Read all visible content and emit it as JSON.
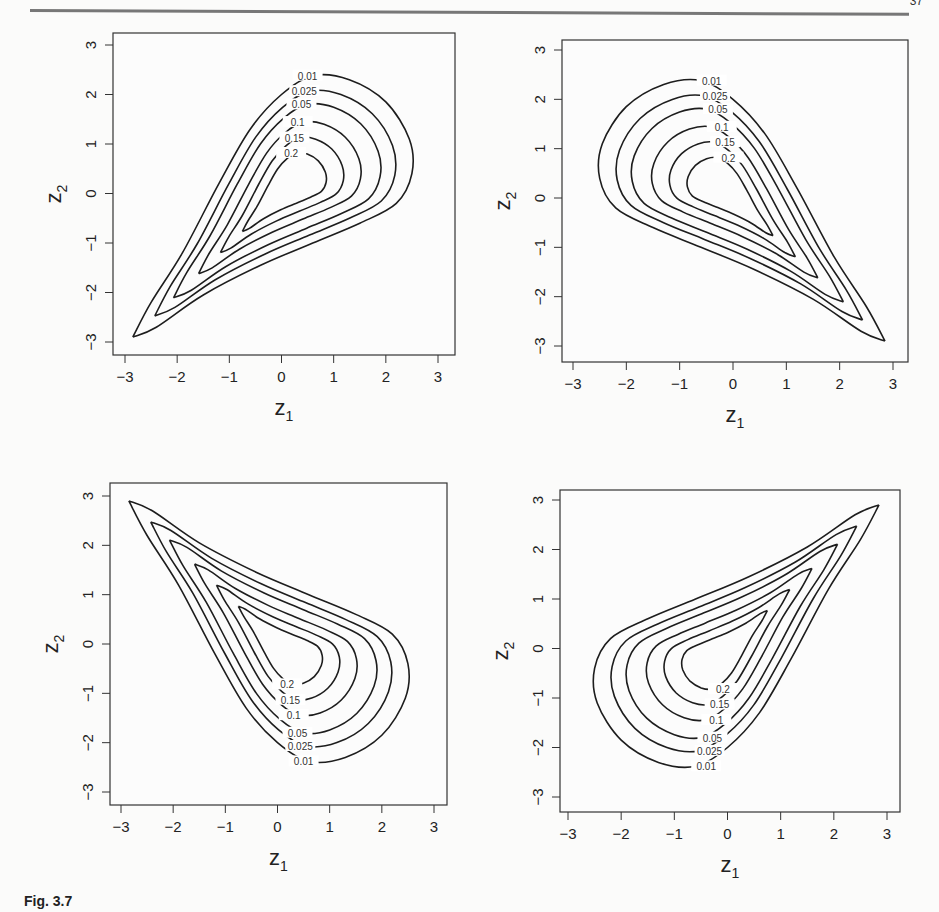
{
  "page": {
    "page_number": "37",
    "caption_fragment": "Fig. 3.7"
  },
  "chart_data": [
    {
      "type": "contour",
      "title": "",
      "position": "top-left",
      "xlabel": "z1",
      "ylabel": "z2",
      "xlim": [
        -3,
        3
      ],
      "ylim": [
        -3,
        3
      ],
      "xticks": [
        -3,
        -2,
        -1,
        0,
        1,
        2,
        3
      ],
      "yticks": [
        -3,
        -2,
        -1,
        0,
        1,
        2,
        3
      ],
      "levels": [
        0.01,
        0.025,
        0.05,
        0.1,
        0.15,
        0.2
      ],
      "orientation": "tail toward lower-left, bulb toward upper-right",
      "tail_point": [
        -2.85,
        -2.9
      ],
      "bulb_extent": {
        "max_x": 2.55,
        "max_y": 2.4
      },
      "grid": false,
      "legend": "none (inline contour labels)"
    },
    {
      "type": "contour",
      "position": "top-right",
      "xlabel": "z1",
      "ylabel": "z2",
      "xlim": [
        -3,
        3
      ],
      "ylim": [
        -3,
        3
      ],
      "xticks": [
        -3,
        -2,
        -1,
        0,
        1,
        2,
        3
      ],
      "yticks": [
        -3,
        -2,
        -1,
        0,
        1,
        2,
        3
      ],
      "levels": [
        0.01,
        0.025,
        0.05,
        0.1,
        0.15,
        0.2
      ],
      "orientation": "tail toward lower-right, bulb toward upper-left",
      "tail_point": [
        2.9,
        -2.95
      ],
      "bulb_extent": {
        "min_x": -2.55,
        "max_y": 2.4
      },
      "grid": false,
      "legend": "none (inline contour labels)"
    },
    {
      "type": "contour",
      "position": "bottom-left",
      "xlabel": "z1",
      "ylabel": "z2",
      "xlim": [
        -3,
        3
      ],
      "ylim": [
        -3,
        3
      ],
      "xticks": [
        -3,
        -2,
        -1,
        0,
        1,
        2,
        3
      ],
      "yticks": [
        -3,
        -2,
        -1,
        0,
        1,
        2,
        3
      ],
      "levels": [
        0.01,
        0.025,
        0.05,
        0.1,
        0.15,
        0.2
      ],
      "orientation": "tail toward upper-right, bulb toward lower-left",
      "tail_point": [
        2.9,
        2.85
      ],
      "bulb_extent": {
        "min_x": -2.55,
        "min_y": -2.45
      },
      "grid": false,
      "legend": "none (inline contour labels)"
    },
    {
      "type": "contour",
      "position": "bottom-right",
      "xlabel": "z1",
      "ylabel": "z2",
      "xlim": [
        -3,
        3
      ],
      "ylim": [
        -3,
        3
      ],
      "xticks": [
        -3,
        -2,
        -1,
        0,
        1,
        2,
        3
      ],
      "yticks": [
        -3,
        -2,
        -1,
        0,
        1,
        2,
        3
      ],
      "levels": [
        0.01,
        0.025,
        0.05,
        0.1,
        0.15,
        0.2
      ],
      "orientation": "tail toward upper-left, bulb toward lower-right",
      "tail_point": [
        -2.85,
        2.9
      ],
      "bulb_extent": {
        "max_x": 2.55,
        "min_y": -2.45
      },
      "grid": false,
      "legend": "none (inline contour labels)"
    }
  ],
  "panels": [
    {
      "id": "tl",
      "left": 60,
      "top": 28,
      "box": [
        113,
        33,
        455,
        355
      ],
      "xmap": [
        125,
        438
      ],
      "ymap": [
        342,
        45
      ],
      "sx": 1,
      "sy": 1
    },
    {
      "id": "tr",
      "left": 510,
      "top": 28,
      "box": [
        562,
        40,
        908,
        362
      ],
      "xmap": [
        573,
        893
      ],
      "ymap": [
        346,
        50
      ],
      "sx": -1,
      "sy": 1
    },
    {
      "id": "bl",
      "left": 60,
      "top": 478,
      "box": [
        110,
        483,
        447,
        805
      ],
      "xmap": [
        121,
        434
      ],
      "ymap": [
        792,
        496
      ],
      "sx": 1,
      "sy": -1
    },
    {
      "id": "br",
      "left": 510,
      "top": 478,
      "box": [
        560,
        490,
        900,
        812
      ],
      "xmap": [
        568,
        887
      ],
      "ymap": [
        797,
        500
      ],
      "sx": -1,
      "sy": -1
    }
  ],
  "labels": {
    "x_axis": "z",
    "x_sub": "1",
    "y_axis": "z",
    "y_sub": "2"
  }
}
